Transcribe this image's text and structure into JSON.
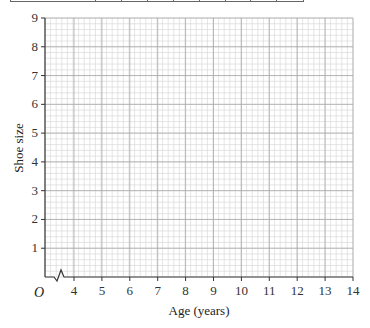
{
  "table_strip": {
    "columns": 9,
    "note": "Top edge of a data table, cut off; cell contents not visible"
  },
  "chart_data": {
    "type": "scatter",
    "title": "",
    "xlabel": "Age (years)",
    "ylabel": "Shoe size",
    "origin_label": "O",
    "x_axis_break": true,
    "xlim": [
      3,
      14
    ],
    "ylim": [
      0,
      9
    ],
    "x_ticks": [
      4,
      5,
      6,
      7,
      8,
      9,
      10,
      11,
      12,
      13,
      14
    ],
    "y_ticks": [
      1,
      2,
      3,
      4,
      5,
      6,
      7,
      8,
      9
    ],
    "grid": {
      "major": true,
      "minor_divisions": 5
    },
    "series": [],
    "points": []
  },
  "colors": {
    "grid_minor": "#d4d4d4",
    "grid_major": "#a8a8a8",
    "axis": "#333333"
  }
}
